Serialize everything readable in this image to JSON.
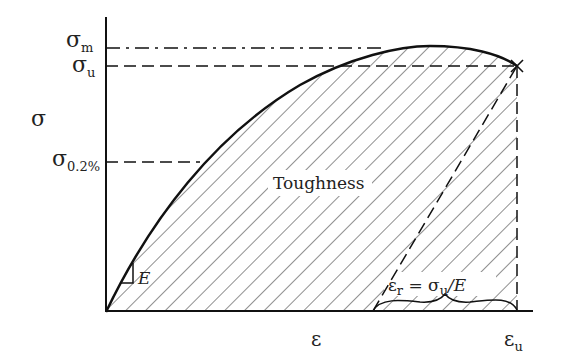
{
  "diagram": {
    "type": "stress-strain curve",
    "colors": {
      "stroke": "#111111",
      "hatch": "#333333",
      "background": "#ffffff"
    },
    "axes": {
      "y_label": "σ",
      "x_label": "ε"
    },
    "y_levels": [
      {
        "symbol": "σ",
        "subscript": "m",
        "line_style": "dash-dot"
      },
      {
        "symbol": "σ",
        "subscript": "u",
        "line_style": "dashed"
      },
      {
        "symbol": "σ",
        "subscript": "0.2%",
        "line_style": "dashed"
      }
    ],
    "x_levels": [
      {
        "symbol": "ε",
        "subscript": "u",
        "line_style": "dashed"
      }
    ],
    "region_label": "Toughness",
    "slope_label": "E",
    "recovery_label": {
      "lhs_symbol": "ε",
      "lhs_subscript": "r",
      "equals": "=",
      "rhs_symbol": "σ",
      "rhs_subscript": "u",
      "divisor": "/E"
    }
  }
}
